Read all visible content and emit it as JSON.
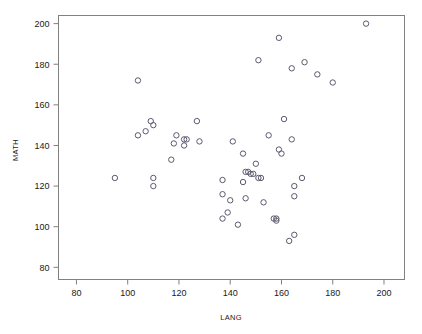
{
  "chart_data": {
    "type": "scatter",
    "title": "",
    "xlabel": "LANG",
    "ylabel": "MATH",
    "xlim": [
      73,
      208
    ],
    "ylim": [
      74,
      204
    ],
    "xticks": [
      80,
      100,
      120,
      140,
      160,
      180,
      200
    ],
    "yticks": [
      80,
      100,
      120,
      140,
      160,
      180,
      200
    ],
    "xtick_labels": [
      "80",
      "100",
      "120",
      "140",
      "160",
      "180",
      "200"
    ],
    "ytick_labels": [
      "80",
      "100",
      "120",
      "140",
      "160",
      "180",
      "200"
    ],
    "grid": false,
    "legend": null,
    "marker": "open-circle",
    "marker_color": "#5a5a6e",
    "frame_color": "#808080",
    "n_points": 62,
    "points": [
      {
        "x": 95,
        "y": 124
      },
      {
        "x": 104,
        "y": 172
      },
      {
        "x": 104,
        "y": 145
      },
      {
        "x": 107,
        "y": 147
      },
      {
        "x": 109,
        "y": 152
      },
      {
        "x": 110,
        "y": 150
      },
      {
        "x": 110,
        "y": 124
      },
      {
        "x": 110,
        "y": 120
      },
      {
        "x": 117,
        "y": 133
      },
      {
        "x": 118,
        "y": 141
      },
      {
        "x": 119,
        "y": 145
      },
      {
        "x": 122,
        "y": 143
      },
      {
        "x": 122,
        "y": 140
      },
      {
        "x": 123,
        "y": 143
      },
      {
        "x": 127,
        "y": 152
      },
      {
        "x": 128,
        "y": 142
      },
      {
        "x": 137,
        "y": 123
      },
      {
        "x": 137,
        "y": 116
      },
      {
        "x": 137,
        "y": 104
      },
      {
        "x": 139,
        "y": 107
      },
      {
        "x": 140,
        "y": 113
      },
      {
        "x": 141,
        "y": 142
      },
      {
        "x": 143,
        "y": 101
      },
      {
        "x": 145,
        "y": 136
      },
      {
        "x": 145,
        "y": 122
      },
      {
        "x": 146,
        "y": 127
      },
      {
        "x": 146,
        "y": 114
      },
      {
        "x": 147,
        "y": 127
      },
      {
        "x": 148,
        "y": 126
      },
      {
        "x": 149,
        "y": 126
      },
      {
        "x": 150,
        "y": 131
      },
      {
        "x": 151,
        "y": 182
      },
      {
        "x": 151,
        "y": 124
      },
      {
        "x": 152,
        "y": 124
      },
      {
        "x": 153,
        "y": 112
      },
      {
        "x": 155,
        "y": 145
      },
      {
        "x": 157,
        "y": 104
      },
      {
        "x": 158,
        "y": 104
      },
      {
        "x": 158,
        "y": 103
      },
      {
        "x": 159,
        "y": 193
      },
      {
        "x": 159,
        "y": 138
      },
      {
        "x": 160,
        "y": 136
      },
      {
        "x": 161,
        "y": 153
      },
      {
        "x": 163,
        "y": 93
      },
      {
        "x": 164,
        "y": 178
      },
      {
        "x": 164,
        "y": 143
      },
      {
        "x": 165,
        "y": 96
      },
      {
        "x": 165,
        "y": 115
      },
      {
        "x": 165,
        "y": 120
      },
      {
        "x": 168,
        "y": 124
      },
      {
        "x": 169,
        "y": 181
      },
      {
        "x": 174,
        "y": 175
      },
      {
        "x": 180,
        "y": 171
      },
      {
        "x": 193,
        "y": 200
      }
    ]
  }
}
